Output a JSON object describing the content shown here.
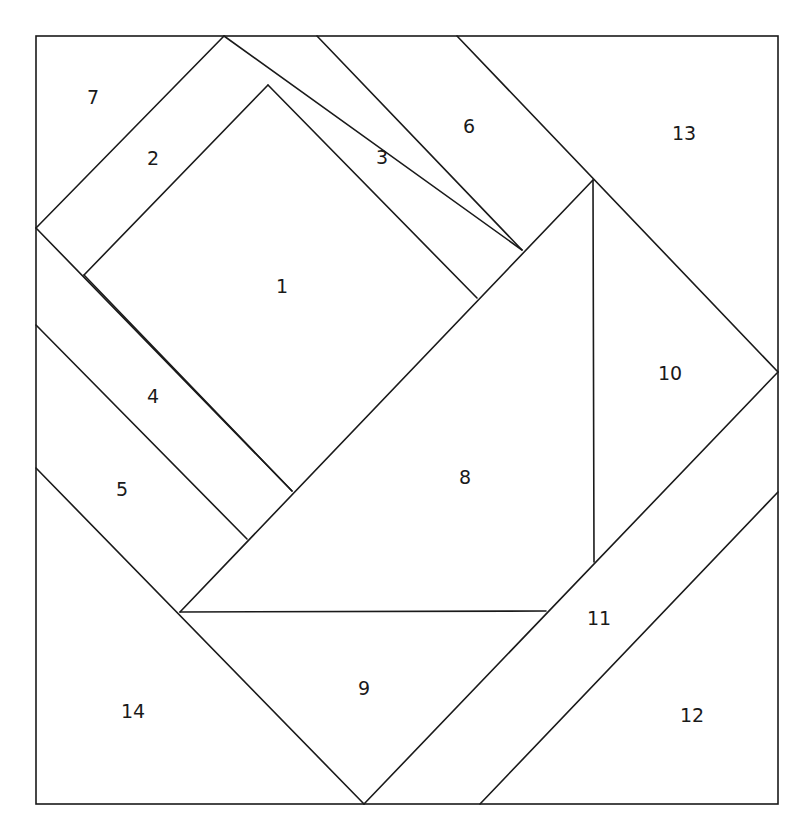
{
  "diagram": {
    "type": "foundation-paper-piecing-pattern",
    "line_color": "#1a1a1a",
    "background": "#ffffff",
    "frame": {
      "x": 36,
      "y": 36,
      "width": 742,
      "height": 768
    },
    "segments": [
      [
        224,
        36,
        36,
        228
      ],
      [
        224,
        36,
        522,
        250
      ],
      [
        268,
        85,
        84,
        275
      ],
      [
        268,
        85,
        477,
        298
      ],
      [
        317,
        36,
        522,
        250
      ],
      [
        457,
        36,
        778,
        372
      ],
      [
        36,
        228,
        292,
        491
      ],
      [
        84,
        275,
        292,
        491
      ],
      [
        36,
        325,
        247,
        539
      ],
      [
        36,
        468,
        364,
        804
      ],
      [
        593,
        180,
        180,
        612
      ],
      [
        593,
        180,
        594,
        562
      ],
      [
        180,
        612,
        546,
        611
      ],
      [
        778,
        372,
        364,
        804
      ],
      [
        778,
        492,
        480,
        804
      ]
    ],
    "pieces": [
      {
        "number": "1",
        "x": 282,
        "y": 286
      },
      {
        "number": "2",
        "x": 153,
        "y": 158
      },
      {
        "number": "3",
        "x": 382,
        "y": 157
      },
      {
        "number": "4",
        "x": 153,
        "y": 396
      },
      {
        "number": "5",
        "x": 122,
        "y": 489
      },
      {
        "number": "6",
        "x": 469,
        "y": 126
      },
      {
        "number": "7",
        "x": 93,
        "y": 97
      },
      {
        "number": "8",
        "x": 465,
        "y": 477
      },
      {
        "number": "9",
        "x": 364,
        "y": 688
      },
      {
        "number": "10",
        "x": 670,
        "y": 373
      },
      {
        "number": "11",
        "x": 599,
        "y": 618
      },
      {
        "number": "12",
        "x": 692,
        "y": 715
      },
      {
        "number": "13",
        "x": 684,
        "y": 133
      },
      {
        "number": "14",
        "x": 133,
        "y": 711
      }
    ]
  }
}
